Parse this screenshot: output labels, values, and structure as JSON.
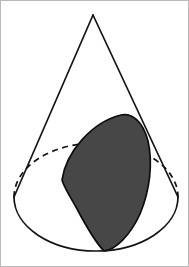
{
  "figure": {
    "title": "Cone with shaded conic section",
    "caption": "",
    "canvas": {
      "width": 189,
      "height": 267,
      "background_color": "#ffffff",
      "border_color": "#b9b9b9"
    },
    "colors": {
      "outline": "#141414",
      "section_fill": "#474747",
      "section_outline": "#0d0d0d",
      "background": "#ffffff",
      "frame": "#b9b9b9"
    },
    "geometry": {
      "apex": {
        "x": 93,
        "y": 15
      },
      "base_ellipse": {
        "center_x": 96,
        "center_y": 197,
        "radius_x": 82,
        "radius_y": 54,
        "left_vertex": {
          "x": 14,
          "y": 197
        },
        "right_vertex": {
          "x": 178,
          "y": 197
        },
        "bottom_point": {
          "x": 96,
          "y": 251
        },
        "top_point": {
          "x": 96,
          "y": 143
        }
      },
      "left_slant": {
        "from_x": 93,
        "from_y": 15,
        "to_x": 14,
        "to_y": 197
      },
      "right_slant": {
        "from_x": 93,
        "from_y": 15,
        "to_x": 178,
        "to_y": 197
      },
      "section": {
        "left_vertex": {
          "x": 62,
          "y": 180
        },
        "upper_apex": {
          "x": 128,
          "y": 116
        },
        "bottom_vertex": {
          "x": 104,
          "y": 251
        },
        "right_waist": {
          "x": 150,
          "y": 160
        }
      }
    },
    "parts": [
      {
        "name": "cone-lateral-outline",
        "style": "solid",
        "label": "Cone lateral edges"
      },
      {
        "name": "base-front-arc",
        "style": "solid",
        "label": "Front half of base circle"
      },
      {
        "name": "base-back-arc",
        "style": "dashed",
        "label": "Hidden back half of base circle"
      },
      {
        "name": "conic-section-region",
        "style": "filled",
        "label": "Shaded conic section"
      }
    ]
  }
}
